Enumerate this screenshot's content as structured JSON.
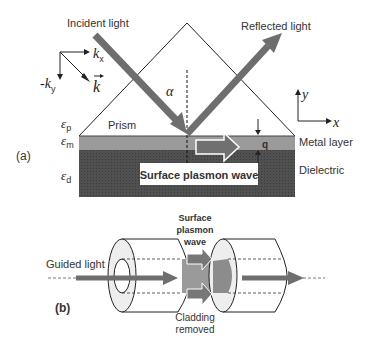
{
  "panel_a": {
    "label": "(a)",
    "incident_light": "Incident light",
    "reflected_light": "Reflected light",
    "alpha": "α",
    "prism": "Prism",
    "metal_layer": "Metal layer",
    "dielectric": "Dielectric",
    "surface_plasmon_wave": "Surface plasmon wave",
    "q": "q",
    "eps_p": {
      "sym": "ε",
      "sub": "p"
    },
    "eps_m": {
      "sym": "ε",
      "sub": "m"
    },
    "eps_d": {
      "sym": "ε",
      "sub": "d"
    },
    "kx": {
      "sym": "k",
      "sub": "x"
    },
    "ky": {
      "sym": "-k",
      "sub": "y"
    },
    "k_vec": "k",
    "axis_y": "y",
    "axis_x": "x",
    "colors": {
      "metal": "#9a9a9a",
      "dielectric": "#4a4a4a",
      "arrow": "#6e6e6e"
    }
  },
  "panel_b": {
    "label": "(b)",
    "guided_light": "Guided light",
    "spw_line1": "Surface",
    "spw_line2": "plasmon",
    "spw_line3": "wave",
    "cladding_line1": "Cladding",
    "cladding_line2": "removed"
  }
}
